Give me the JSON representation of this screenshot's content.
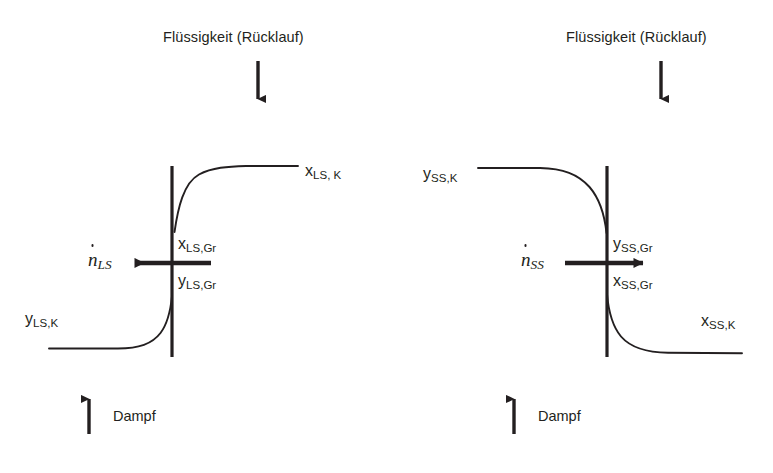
{
  "figure": {
    "type": "process-schematic",
    "background_color": "#ffffff",
    "line_color": "#231f20"
  },
  "panels": [
    {
      "id": "left",
      "name": "leichtsieder-panel",
      "top_label": "Flüssigkeit (Rücklauf)",
      "bottom_label": "Dampf",
      "flow_label": {
        "symbol": "n",
        "dot": true,
        "subscript": "LS"
      },
      "labels": {
        "upper_outer": "x",
        "upper_outer_sub": "LS, K",
        "interface_upper": "x",
        "interface_upper_sub": "LS,Gr",
        "interface_lower": "y",
        "interface_lower_sub": "LS,Gr",
        "lower_outer": "y",
        "lower_outer_sub": "LS,K"
      },
      "arrow_direction": "left",
      "top_arrow_direction": "down",
      "bottom_arrow_direction": "up"
    },
    {
      "id": "right",
      "name": "schwersieder-panel",
      "top_label": "Flüssigkeit (Rücklauf)",
      "bottom_label": "Dampf",
      "flow_label": {
        "symbol": "n",
        "dot": true,
        "subscript": "SS"
      },
      "labels": {
        "upper_outer": "y",
        "upper_outer_sub": "SS,K",
        "interface_upper": "y",
        "interface_upper_sub": "SS,Gr",
        "interface_lower": "x",
        "interface_lower_sub": "SS,Gr",
        "lower_outer": "x",
        "lower_outer_sub": "SS,K"
      },
      "arrow_direction": "right",
      "top_arrow_direction": "down",
      "bottom_arrow_direction": "up"
    }
  ],
  "text": {
    "left_heading": "Flüssigkeit (Rücklauf)",
    "right_heading": "Flüssigkeit (Rücklauf)",
    "left_dampf": "Dampf",
    "right_dampf": "Dampf",
    "left_n_symbol": "n",
    "left_n_sub": "LS",
    "right_n_symbol": "n",
    "right_n_sub": "SS",
    "l_x_top": "x",
    "l_x_top_sub": "LS, K",
    "l_x_gr": "x",
    "l_x_gr_sub": "LS,Gr",
    "l_y_gr": "y",
    "l_y_gr_sub": "LS,Gr",
    "l_y_bot": "y",
    "l_y_bot_sub": "LS,K",
    "r_y_top": "y",
    "r_y_top_sub": "SS,K",
    "r_y_gr": "y",
    "r_y_gr_sub": "SS,Gr",
    "r_x_gr": "x",
    "r_x_gr_sub": "SS,Gr",
    "r_x_bot": "x",
    "r_x_bot_sub": "SS,K"
  }
}
